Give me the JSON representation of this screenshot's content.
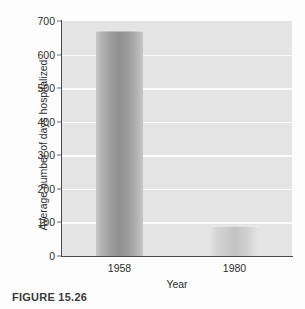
{
  "caption": "FIGURE 15.26",
  "chart_data": {
    "type": "bar",
    "title": "",
    "xlabel": "Year",
    "ylabel": "Average number of days hospitalized",
    "categories": [
      "1958",
      "1980"
    ],
    "values": [
      670,
      90
    ],
    "series": [
      {
        "name": "Average number of days hospitalized",
        "values": [
          670,
          90
        ]
      }
    ],
    "ylim": [
      0,
      700
    ],
    "yticks": [
      0,
      100,
      200,
      300,
      400,
      500,
      600,
      700
    ],
    "ytick_labels": [
      "0",
      "100",
      "200",
      "300",
      "400",
      "500",
      "600",
      "700"
    ],
    "grid": true,
    "grid_axis": "y",
    "grid_color": "#fbfbfb",
    "legend": false,
    "legend_position": "none",
    "plot_background": "#e4e4e4",
    "bar_colors": [
      "#909090",
      "#c3c3c3"
    ],
    "axis_color": "#4a4a4a",
    "text_color": "#2e2e2e"
  }
}
